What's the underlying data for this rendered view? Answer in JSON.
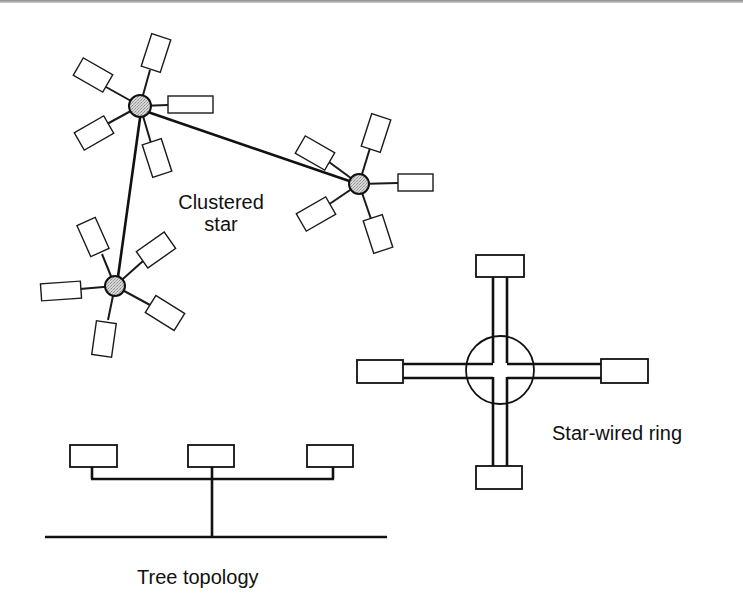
{
  "figure": {
    "labels": {
      "clustered_star_line1": "Clustered",
      "clustered_star_line2": "star",
      "star_wired_ring": "Star-wired ring",
      "tree_topology": "Tree topology"
    },
    "colors": {
      "line": "#111111",
      "hub_fill": "#c8c8c8",
      "device_fill": "#ffffff",
      "background": "#ffffff"
    },
    "topologies": [
      {
        "name": "Clustered star",
        "hubs": [
          {
            "id": "hub-1",
            "cx": 140,
            "cy": 106,
            "devices": 5
          },
          {
            "id": "hub-2",
            "cx": 359,
            "cy": 184,
            "devices": 5
          },
          {
            "id": "hub-3",
            "cx": 115,
            "cy": 286,
            "devices": 5
          }
        ],
        "hub_links": [
          [
            "hub-1",
            "hub-2"
          ],
          [
            "hub-1",
            "hub-3"
          ]
        ]
      },
      {
        "name": "Star-wired ring",
        "center": {
          "cx": 500,
          "cy": 370,
          "r": 34
        },
        "stations": [
          "top",
          "right",
          "bottom",
          "left"
        ]
      },
      {
        "name": "Tree topology",
        "devices": 3,
        "bus": {
          "x1": 45,
          "x2": 387,
          "y": 537
        }
      }
    ]
  }
}
